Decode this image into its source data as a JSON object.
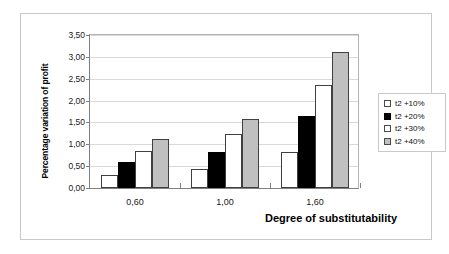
{
  "chart_data": {
    "type": "bar",
    "title": "",
    "xlabel": "Degree of substitutability",
    "ylabel": "Percentage variation of profit",
    "categories": [
      "0,60",
      "1,00",
      "1,60"
    ],
    "series": [
      {
        "name": "t2 +10%",
        "color": "#ffffff",
        "fill": "fill-white",
        "values": [
          0.3,
          0.42,
          0.82
        ]
      },
      {
        "name": "t2 +20%",
        "color": "#000000",
        "fill": "fill-black",
        "values": [
          0.59,
          0.81,
          1.63
        ]
      },
      {
        "name": "t2 +30%",
        "color": "#ffffff",
        "fill": "fill-white",
        "values": [
          0.84,
          1.22,
          2.32
        ]
      },
      {
        "name": "t2 +40%",
        "color": "#c0c0c0",
        "fill": "fill-gray",
        "values": [
          1.1,
          1.56,
          3.08
        ]
      }
    ],
    "ylim": [
      0.0,
      3.5
    ],
    "ytick_labels": [
      "0,00",
      "0,50",
      "1,00",
      "1,50",
      "2,00",
      "2,50",
      "3,00",
      "3,50"
    ],
    "ytick_values": [
      0.0,
      0.5,
      1.0,
      1.5,
      2.0,
      2.5,
      3.0,
      3.5
    ],
    "grid": true,
    "legend_position": "right"
  }
}
